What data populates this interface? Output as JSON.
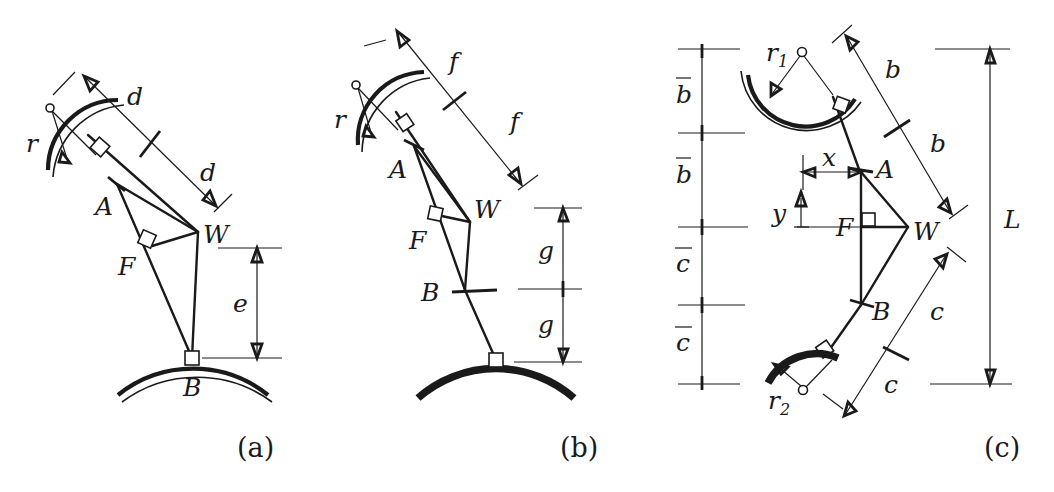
{
  "figure": {
    "background_color": "#ffffff",
    "ink_color": "#1a1a1a"
  },
  "panels": [
    {
      "id": "a",
      "label": "(a)",
      "labels": {
        "joint_a": "A",
        "joint_b": "B",
        "joint_f": "F",
        "joint_w": "W",
        "radius": "r",
        "dim_upper": "d",
        "dim_lower": "d",
        "dim_vertical": "e"
      }
    },
    {
      "id": "b",
      "label": "(b)",
      "labels": {
        "joint_a": "A",
        "joint_b": "B",
        "joint_f": "F",
        "joint_w": "W",
        "radius": "r",
        "dim_upper": "f",
        "dim_lower": "f",
        "dim_vertical_upper": "g",
        "dim_vertical_lower": "g"
      }
    },
    {
      "id": "c",
      "label": "(c)",
      "labels": {
        "joint_a": "A",
        "joint_b": "B",
        "joint_f": "F",
        "joint_w": "W",
        "radius_top": "r",
        "radius_top_sub": "1",
        "radius_bottom": "r",
        "radius_bottom_sub": "2",
        "dim_b_upper": "b",
        "dim_b_lower": "b",
        "dim_c_upper": "c",
        "dim_c_lower": "c",
        "ladder_1": "b",
        "ladder_2": "b",
        "ladder_3": "c",
        "ladder_4": "c",
        "dim_total": "L",
        "offset_x": "x",
        "offset_y": "y"
      }
    }
  ]
}
